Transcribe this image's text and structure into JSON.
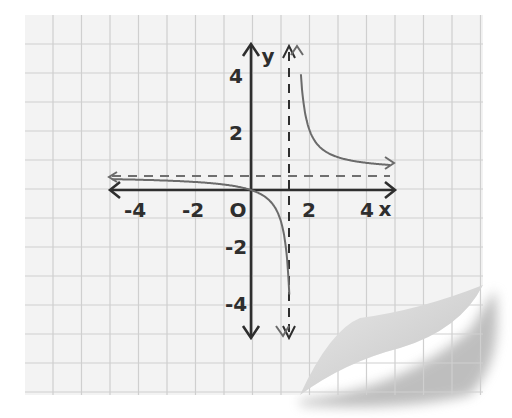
{
  "chart_data": {
    "type": "line",
    "title": "",
    "function_description": "Rational function with vertical asymptote near x = 1.5 and horizontal asymptote near y = 0.5, passing through the origin",
    "xlabel": "x",
    "ylabel": "y",
    "xlim": [
      -4.8,
      4.8
    ],
    "ylim": [
      -5.2,
      5.2
    ],
    "x_ticks": [
      -4,
      -2,
      0,
      2,
      4
    ],
    "x_tick_labels": [
      "-4",
      "-2",
      "O",
      "2",
      "4"
    ],
    "y_ticks": [
      4,
      2,
      -2,
      -4
    ],
    "y_tick_labels": [
      "4",
      "2",
      "-2",
      "-4"
    ],
    "grid": true,
    "asymptotes": {
      "vertical_x": 1.5,
      "horizontal_y": 0.5
    },
    "series": [
      {
        "name": "left branch",
        "x": [
          -4.8,
          -4,
          -3,
          -2,
          -1,
          0,
          0.5,
          1,
          1.25,
          1.4
        ],
        "y": [
          0.38,
          0.36,
          0.33,
          0.29,
          0.2,
          0,
          -0.25,
          -1,
          -2.5,
          -7
        ]
      },
      {
        "name": "right branch",
        "x": [
          1.6,
          1.75,
          2,
          2.5,
          3,
          3.5,
          4,
          4.8
        ],
        "y": [
          8,
          3.5,
          2,
          1.25,
          1,
          0.88,
          0.8,
          0.73
        ]
      }
    ],
    "colors": {
      "curve": "#6b6b6b",
      "axes": "#2e2e2e",
      "asymptote": "#6f6f6f",
      "grid": "#cfcfcf",
      "paper": "#f3f3f3"
    }
  }
}
